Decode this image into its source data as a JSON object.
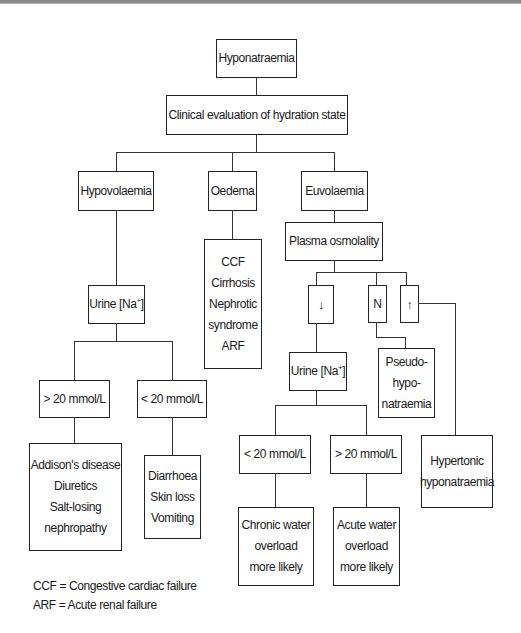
{
  "diagram": {
    "title": "Hyponatraemia",
    "step1": "Clinical evaluation of hydration state",
    "branches": {
      "hypovolaemia": {
        "label": "Hypovolaemia",
        "test": "Urine [Na",
        "test_sup": "+",
        "test_close": "]",
        "high": {
          "label": "> 20 mmol/L",
          "causes": [
            "Addison's disease",
            "Diuretics",
            "Salt-losing",
            "nephropathy"
          ]
        },
        "low": {
          "label": "< 20 mmol/L",
          "causes": [
            "Diarrhoea",
            "Skin loss",
            "Vomiting"
          ]
        }
      },
      "oedema": {
        "label": "Oedema",
        "causes": [
          "CCF",
          "Cirrhosis",
          "Nephrotic",
          "syndrome",
          "ARF"
        ]
      },
      "euvolaemia": {
        "label": "Euvolaemia",
        "test": "Plasma osmolality",
        "low_symbol": "↓",
        "normal_symbol": "N",
        "high_symbol": "↑",
        "normal_result": [
          "Pseudo-",
          "hypo-",
          "natraemia"
        ],
        "high_result": [
          "Hypertonic",
          "hyponatraemia"
        ],
        "low_test": "Urine [Na",
        "low_test_sup": "+",
        "low_test_close": "]",
        "urine_low": {
          "label": "< 20 mmol/L",
          "result": [
            "Chronic water",
            "overload",
            "more likely"
          ]
        },
        "urine_high": {
          "label": "> 20 mmol/L",
          "result": [
            "Acute water",
            "overload",
            "more likely"
          ]
        }
      }
    },
    "legend": [
      "CCF = Congestive cardiac failure",
      "ARF = Acute renal failure"
    ]
  }
}
